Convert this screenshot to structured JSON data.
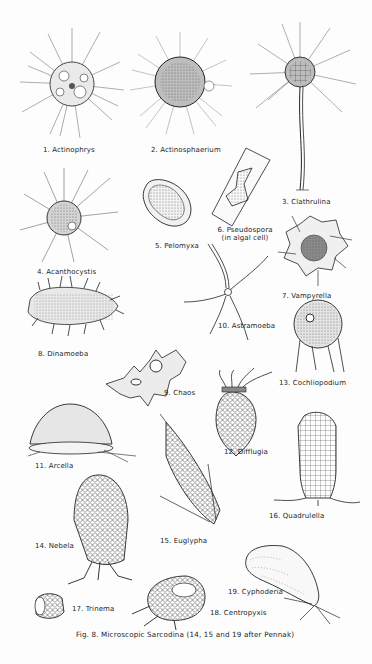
{
  "figure": {
    "caption": "Fig. 8.  Microscopic Sarcodina (14, 15 and 19 after Pennak)",
    "organisms": [
      {
        "number": 1,
        "label": "1. Actinophrys"
      },
      {
        "number": 2,
        "label": "2. Actinosphaerium"
      },
      {
        "number": 3,
        "label": "3. Clathrulina"
      },
      {
        "number": 4,
        "label": "4. Acanthocystis"
      },
      {
        "number": 5,
        "label": "5. Pelomyxa"
      },
      {
        "number": 6,
        "label": "6. Pseudospora",
        "sublabel": "(in algal cell)"
      },
      {
        "number": 7,
        "label": "7. Vampyrella"
      },
      {
        "number": 8,
        "label": "8. Dinamoeba"
      },
      {
        "number": 9,
        "label": "9. Chaos"
      },
      {
        "number": 10,
        "label": "10. Astramoeba"
      },
      {
        "number": 11,
        "label": "11. Arcella"
      },
      {
        "number": 12,
        "label": "12. Difflugia"
      },
      {
        "number": 13,
        "label": "13. Cochliopodium"
      },
      {
        "number": 14,
        "label": "14. Nebela"
      },
      {
        "number": 15,
        "label": "15. Euglypha"
      },
      {
        "number": 16,
        "label": "16. Quadrulella"
      },
      {
        "number": 17,
        "label": "17. Trinema"
      },
      {
        "number": 18,
        "label": "18. Centropyxis"
      },
      {
        "number": 19,
        "label": "19. Cyphoderia"
      }
    ]
  }
}
